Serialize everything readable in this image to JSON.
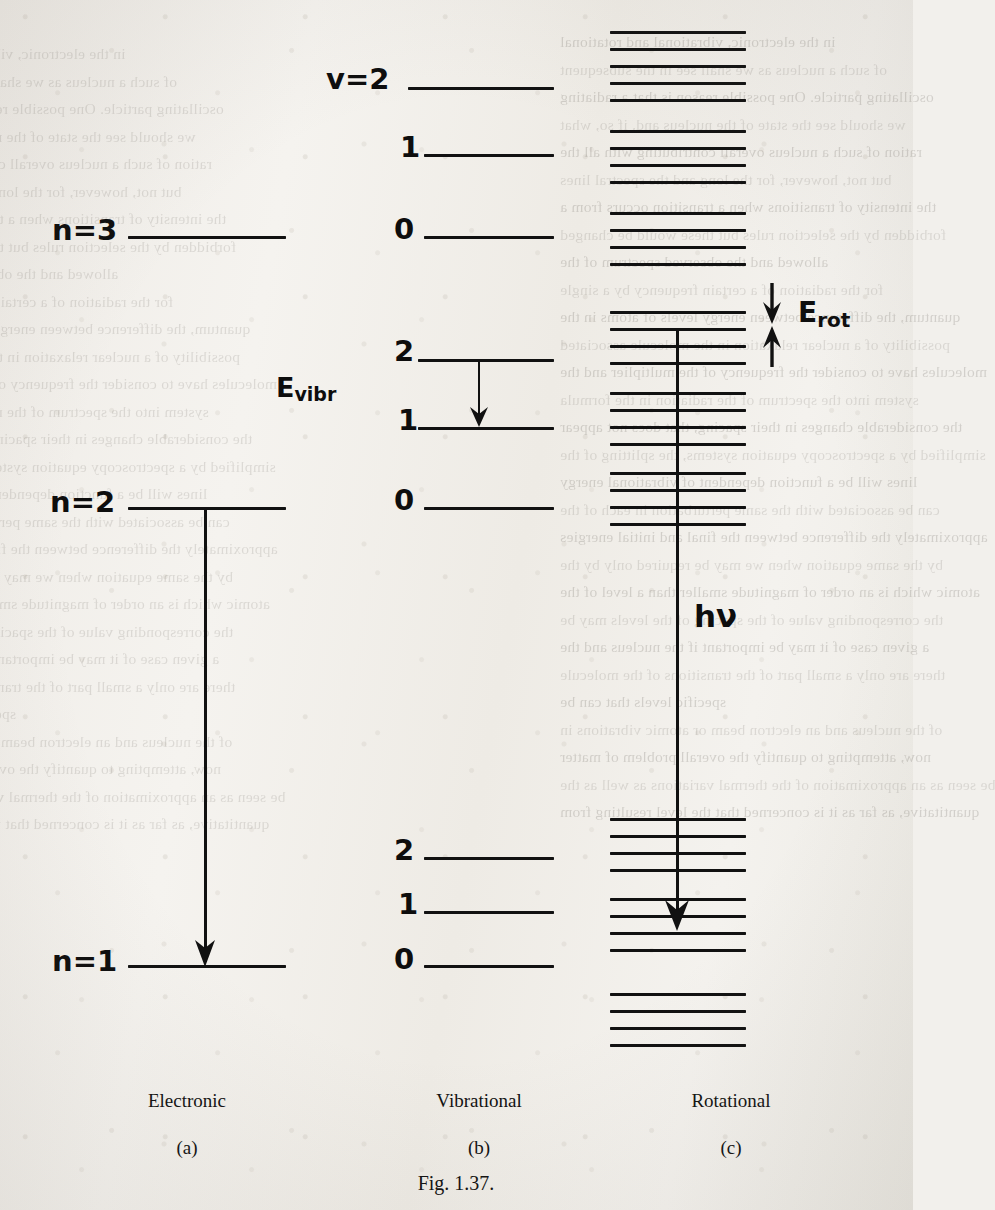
{
  "figure": {
    "caption": "Fig. 1.37.",
    "columns": [
      {
        "id": "a",
        "name": "Electronic",
        "tag": "(a)"
      },
      {
        "id": "b",
        "name": "Vibrational",
        "tag": "(b)"
      },
      {
        "id": "c",
        "name": "Rotational",
        "tag": "(c)"
      }
    ],
    "energy_labels": {
      "vibrational": "E",
      "vibrational_sub": "vibr",
      "rotational": "E",
      "rotational_sub": "rot",
      "photon": "hν"
    }
  },
  "chart_data": {
    "type": "diagram",
    "title": "Fig. 1.37.",
    "subtitle": "Molecular energy level diagram: electronic, vibrational and rotational levels",
    "xlabel": "",
    "ylabel": "Energy",
    "grid": false,
    "legend": "none",
    "panels": [
      {
        "id": "a",
        "name": "Electronic",
        "tag": "(a)",
        "label_prefix": "n=",
        "levels": [
          {
            "label": "n=3",
            "quantum_number": 3,
            "y": 237
          },
          {
            "label": "n=2",
            "quantum_number": 2,
            "y": 508
          },
          {
            "label": "n=1",
            "quantum_number": 1,
            "y": 966
          }
        ],
        "transition": {
          "label": "hν",
          "from_level": "n=2",
          "to_level": "n=1",
          "direction": "down"
        }
      },
      {
        "id": "b",
        "name": "Vibrational",
        "tag": "(b)",
        "label_prefix": "v=",
        "levels": [
          {
            "label": "v=2",
            "quantum_number": 2,
            "y": 88
          },
          {
            "label": "1",
            "quantum_number": 1,
            "y": 155
          },
          {
            "label": "0",
            "quantum_number": 0,
            "y": 237
          },
          {
            "label": "2",
            "quantum_number": 2,
            "y": 360
          },
          {
            "label": "1",
            "quantum_number": 1,
            "y": 428
          },
          {
            "label": "0",
            "quantum_number": 0,
            "y": 508
          },
          {
            "label": "2",
            "quantum_number": 2,
            "y": 858
          },
          {
            "label": "1",
            "quantum_number": 1,
            "y": 912
          },
          {
            "label": "0",
            "quantum_number": 0,
            "y": 966
          }
        ],
        "energy_gap_label": "E_vibr",
        "transition": {
          "from": 360,
          "to": 428,
          "direction": "down"
        }
      },
      {
        "id": "c",
        "name": "Rotational",
        "tag": "(c)",
        "energy_gap_label": "E_rot",
        "clusters": [
          {
            "group": "upper",
            "count": 5,
            "lines_y": [
              31,
              48,
              65,
              82,
              99
            ]
          },
          {
            "group": "upper",
            "count": 4,
            "lines_y": [
              130,
              147,
              164,
              181
            ]
          },
          {
            "group": "upper",
            "count": 4,
            "lines_y": [
              212,
              229,
              246,
              263
            ]
          },
          {
            "group": "middle",
            "count": 4,
            "lines_y": [
              311,
              328,
              345,
              362
            ]
          },
          {
            "group": "middle",
            "count": 4,
            "lines_y": [
              392,
              409,
              426,
              443
            ]
          },
          {
            "group": "middle",
            "count": 4,
            "lines_y": [
              472,
              489,
              506,
              523
            ]
          },
          {
            "group": "lower",
            "count": 4,
            "lines_y": [
              818,
              835,
              852,
              869
            ]
          },
          {
            "group": "lower",
            "count": 4,
            "lines_y": [
              898,
              915,
              932,
              949
            ]
          },
          {
            "group": "lower",
            "count": 4,
            "lines_y": [
              993,
              1010,
              1027,
              1044
            ]
          }
        ],
        "transition": {
          "label": "hν",
          "from_y": 330,
          "to_y": 930,
          "direction": "down"
        }
      }
    ]
  },
  "bleed_text": {
    "lines": [
      "in the electronic, vibrational and rotational",
      "of such a nucleus as we shall see in the subsequent",
      "oscillating particle. One possible reason is that a radiating",
      "we should see the state of the nucleus and, if so, what",
      "ration of such a nucleus overall contributing with all the",
      "but not, however, for the long and the spectral lines",
      "the intensity of transitions when a transition occurs from a",
      "forbidden by the selection rules but these would be changed",
      "allowed and the observed spectrum of the",
      "for the radiation of a certain frequency by a single",
      "quantum, the difference between energy levels of atoms in the",
      "possibility of a nuclear relaxation in the molecule associated",
      "molecules have to consider the frequency of the multiplier and the",
      "system into the spectrum of the radiation in the formula",
      "the considerable changes in their spacing, that does not appear",
      "simplified by a spectroscopy equation systems, the splitting of the",
      "lines will be a function dependent of vibrational energy",
      "can be associated with the same perturbation in each of the",
      "approximately the difference between the final and initial energies",
      "by the same equation when we may be required only by the",
      "atomic which is an order of magnitude smaller than a level of the",
      "the corresponding value of the spacing of the levels may be",
      "a given case of it may be important if the nucleus and the",
      "there are only a small part of the transitions of the molecule",
      "specific levels that can be",
      "of the nucleus and an electron beam or atomic vibrations in",
      "now, attempting to quantify the overall problem of matter",
      "be seen as an approximation of the thermal variations as well as the",
      "quantitative, as far as it is concerned that the level resulting from"
    ]
  }
}
